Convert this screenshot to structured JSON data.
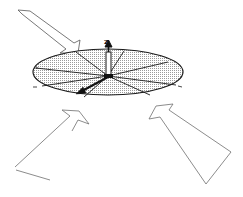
{
  "diagram": {
    "axis_label": "z",
    "colors": {
      "stroke": "#1a1a1a",
      "disc_fill": "#d9d9d9",
      "arrow_stroke": "#6e6e6e"
    },
    "disc": {
      "cx": 108,
      "cy": 72,
      "rx": 75,
      "ry": 23,
      "spokes": 10
    },
    "arrows": [
      {
        "name": "top-left",
        "direction": "down-right toward disc"
      },
      {
        "name": "bottom-left",
        "direction": "up-right toward disc"
      },
      {
        "name": "bottom-right",
        "direction": "up-left toward disc"
      }
    ]
  }
}
